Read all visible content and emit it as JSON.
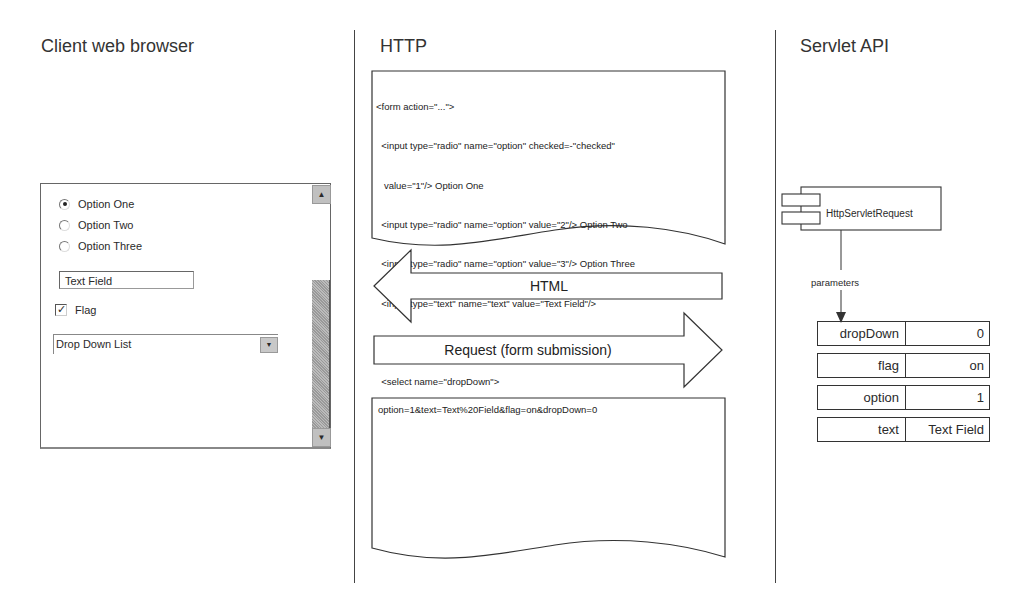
{
  "columns": {
    "client": {
      "title": "Client web browser"
    },
    "http": {
      "title": "HTTP"
    },
    "servlet": {
      "title": "Servlet API"
    }
  },
  "browser_form": {
    "radios": [
      {
        "label": "Option One",
        "checked": true
      },
      {
        "label": "Option Two",
        "checked": false
      },
      {
        "label": "Option Three",
        "checked": false
      }
    ],
    "text_field": {
      "value": "Text Field"
    },
    "checkbox": {
      "label": "Flag",
      "checked": true,
      "glyph": "✓"
    },
    "dropdown": {
      "selected": "Drop Down List",
      "arrow": "▼"
    },
    "scrollbar": {
      "up_arrow": "▲",
      "down_arrow": "▼"
    }
  },
  "http": {
    "html_source": [
      "<form action=\"...\">",
      "  <input type=\"radio\" name=\"option\" checked=-\"checked\"",
      "   value=\"1\"/> Option One",
      "  <input type=\"radio\" name=\"option\" value=\"2\"/> Option Two",
      "  <input type=\"radio\" name=\"option\" value=\"3\"/> Option Three",
      "  <input type=\"text\" name=\"text\" value=\"Text Field\"/>",
      "  <input type=\"checkbox\" name=\"flag\" checked=\"checked\"/> Flag",
      "  <select name=\"dropDown\">",
      "    <option value=\"0\">Drop DownList</option>",
      "  </select>",
      "</form>"
    ],
    "html_arrow_label": "HTML",
    "request_arrow_label": "Request (form submission)",
    "query_string": "option=1&text=Text%20Field&flag=on&dropDown=0"
  },
  "servlet": {
    "component_label": "HttpServletRequest",
    "edge_label": "parameters",
    "parameters": [
      {
        "name": "dropDown",
        "value": "0"
      },
      {
        "name": "flag",
        "value": "on"
      },
      {
        "name": "option",
        "value": "1"
      },
      {
        "name": "text",
        "value": "Text Field"
      }
    ]
  }
}
